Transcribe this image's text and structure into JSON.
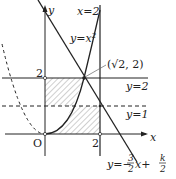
{
  "diagram": {
    "axes": {
      "x_label": "x",
      "y_label": "y",
      "origin_label": "O"
    },
    "ticks": {
      "x_tick_2": "2",
      "y_tick_2": "2"
    },
    "labels": {
      "vertical_line": "x=2",
      "parabola": "y=x",
      "parabola_exp": "2",
      "point": "(√2, 2)",
      "line_y2": "y=2",
      "line_y1": "y=1",
      "line_eq_prefix": "y=−",
      "line_eq_coef_num": "3",
      "line_eq_coef_den": "2",
      "line_eq_mid": "x+",
      "line_eq_k_num": "k",
      "line_eq_k_den": "2"
    },
    "colors": {
      "stroke": "#222222",
      "hatch": "#888888",
      "background": "#ffffff"
    }
  }
}
